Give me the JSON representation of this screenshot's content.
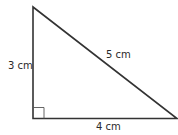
{
  "diagram": {
    "type": "right-triangle",
    "labels": {
      "left_side": "3 cm",
      "hypotenuse": "5 cm",
      "bottom_side": "4 cm"
    },
    "right_angle_marker": true,
    "stroke_color": "#333333"
  }
}
